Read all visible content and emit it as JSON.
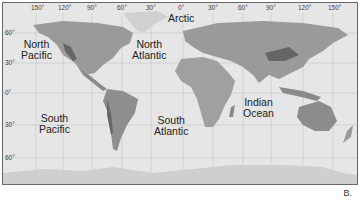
{
  "map": {
    "longitude_labels": [
      "150°",
      "120°",
      "90°",
      "60°",
      "30°",
      "0°",
      "30°",
      "60°",
      "90°",
      "120°",
      "150°"
    ],
    "latitude_labels": [
      "60°",
      "30°",
      "0°",
      "30°",
      "60°"
    ],
    "ocean_labels": [
      {
        "id": "arctic",
        "text": "Arctic"
      },
      {
        "id": "north-pacific",
        "text": "North\nPacific"
      },
      {
        "id": "north-atlantic",
        "text": "North\nAtlantic"
      },
      {
        "id": "south-pacific",
        "text": "South\nPacific"
      },
      {
        "id": "south-atlantic",
        "text": "South\nAtlantic"
      },
      {
        "id": "indian-ocean",
        "text": "Indian\nOcean"
      }
    ],
    "colors": {
      "ocean": "#e6e6e6",
      "land": "#9a9a9a",
      "land_dark": "#6e6e6e",
      "ice": "#d0d0d0",
      "grid": "#bdbdbd"
    }
  },
  "figure_label": "B."
}
